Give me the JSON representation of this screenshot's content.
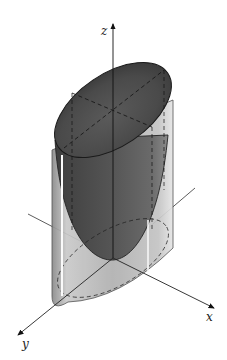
{
  "figure": {
    "axes": {
      "x": {
        "label": "x"
      },
      "y": {
        "label": "y"
      },
      "z": {
        "label": "z"
      }
    },
    "colors": {
      "background": "#ffffff",
      "surface_dark": "#4a4a4a",
      "surface_mid": "#7a7a7a",
      "cylinder_light": "#c8c8c8",
      "axis": "#222222"
    }
  }
}
